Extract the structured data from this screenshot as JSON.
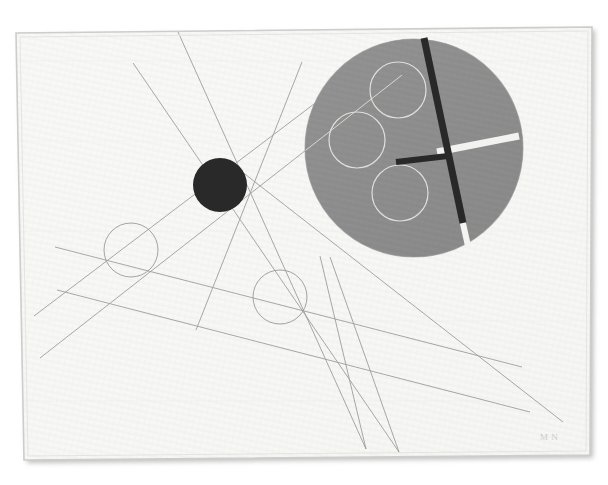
{
  "artwork": {
    "title": "Constructivist Composition with Circles and Lines",
    "medium_surface": "painted canvas with woven texture",
    "signature": "M N",
    "signature_position": "lower right"
  },
  "palette": {
    "background_canvas": "#f6f6f4",
    "background_outer": "#ffffff",
    "frame_edge": "#c9c9c7",
    "frame_shadow": "#b4b4b2",
    "gray_disc": "#7f7f7f",
    "gray_disc_edge": "#777777",
    "black_solid": "#0d0d0d",
    "white_bar": "#f2f2f0",
    "thin_line_dark": "#8c8c8c",
    "thin_line_light": "#d8d8d6",
    "signature_ink": "#c9c9c9"
  },
  "composition": {
    "canvas_rect": {
      "x": 14,
      "y": 26,
      "width": 578,
      "height": 432
    },
    "frame_skew_note": "canvas photographed at slight angle; top edge tilts down to the right"
  },
  "shapes": {
    "gray_disc": {
      "name": "large gray disc",
      "cx": 414,
      "cy": 148,
      "r": 109,
      "fill": "#7f7f7f"
    },
    "black_disc": {
      "name": "solid black circle",
      "cx": 220,
      "cy": 185,
      "r": 27,
      "fill": "#0d0d0d"
    },
    "outline_circles": [
      {
        "name": "lower-left outline circle",
        "cx": 131,
        "cy": 250,
        "r": 27,
        "stroke": "#8c8c8c"
      },
      {
        "name": "center outline circle",
        "cx": 280,
        "cy": 297,
        "r": 27,
        "stroke": "#8c8c8c"
      },
      {
        "name": "disc-top white circle",
        "cx": 398,
        "cy": 90,
        "r": 28,
        "stroke": "#d8d8d6"
      },
      {
        "name": "disc-left white circle",
        "cx": 357,
        "cy": 140,
        "r": 28,
        "stroke": "#d8d8d6"
      },
      {
        "name": "disc-lower white circle",
        "cx": 400,
        "cy": 193,
        "r": 28,
        "stroke": "#d8d8d6"
      }
    ],
    "bars": [
      {
        "name": "black diagonal bar",
        "x1": 424,
        "y1": 38,
        "x2": 463,
        "y2": 223,
        "width": 7,
        "color": "#0d0d0d"
      },
      {
        "name": "white diagonal bar tail",
        "x1": 462,
        "y1": 219,
        "x2": 468,
        "y2": 246,
        "width": 6,
        "color": "#f2f2f0"
      },
      {
        "name": "white horizontal bar",
        "x1": 437,
        "y1": 152,
        "x2": 519,
        "y2": 136,
        "width": 7,
        "color": "#f2f2f0"
      },
      {
        "name": "black short horizontal bar",
        "x1": 396,
        "y1": 162,
        "x2": 448,
        "y2": 156,
        "width": 6,
        "color": "#0d0d0d"
      }
    ],
    "thin_lines": [
      {
        "name": "line-a",
        "x1": 133,
        "y1": 63,
        "x2": 399,
        "y2": 452,
        "stroke": "#8c8c8c"
      },
      {
        "name": "line-b",
        "x1": 178,
        "y1": 32,
        "x2": 366,
        "y2": 449,
        "stroke": "#8c8c8c"
      },
      {
        "name": "line-c",
        "x1": 40,
        "y1": 358,
        "x2": 402,
        "y2": 75,
        "stroke": "#8c8c8c"
      },
      {
        "name": "line-d",
        "x1": 34,
        "y1": 316,
        "x2": 318,
        "y2": 101,
        "stroke": "#8c8c8c"
      },
      {
        "name": "line-e",
        "x1": 55,
        "y1": 247,
        "x2": 522,
        "y2": 367,
        "stroke": "#8c8c8c"
      },
      {
        "name": "line-f",
        "x1": 57,
        "y1": 290,
        "x2": 530,
        "y2": 412,
        "stroke": "#8c8c8c"
      },
      {
        "name": "line-g",
        "x1": 241,
        "y1": 171,
        "x2": 563,
        "y2": 422,
        "stroke": "#8c8c8c"
      },
      {
        "name": "line-h",
        "x1": 302,
        "y1": 62,
        "x2": 196,
        "y2": 330,
        "stroke": "#8c8c8c"
      }
    ]
  },
  "signature": {
    "text": "M N",
    "x": 540,
    "y": 440
  }
}
